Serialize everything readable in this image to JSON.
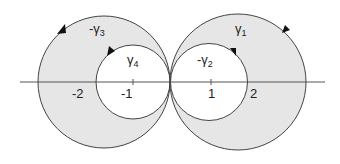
{
  "diagram": {
    "type": "complex-plane contour diagram",
    "colors": {
      "fill": "#e6e6e6",
      "stroke": "#444444",
      "axis": "#555555",
      "text": "#222222"
    },
    "axis": {
      "ticks": [
        {
          "label": "-2",
          "value": -2
        },
        {
          "label": "-1",
          "value": -1
        },
        {
          "label": "1",
          "value": 1
        },
        {
          "label": "2",
          "value": 2
        }
      ]
    },
    "contours": [
      {
        "name": "gamma1",
        "label_sign": "",
        "symbol": "γ",
        "sub": "1",
        "description": "large right circle, counterclockwise"
      },
      {
        "name": "gamma2",
        "label_sign": "-",
        "symbol": "γ",
        "sub": "2",
        "description": "small right circle"
      },
      {
        "name": "gamma3",
        "label_sign": "-",
        "symbol": "γ",
        "sub": "3",
        "description": "large left circle"
      },
      {
        "name": "gamma4",
        "label_sign": "",
        "symbol": "γ",
        "sub": "4",
        "description": "small left circle"
      }
    ]
  }
}
